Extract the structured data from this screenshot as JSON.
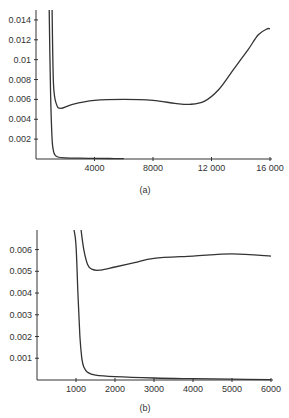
{
  "chart_data": [
    {
      "id": "a",
      "type": "line",
      "caption": "(a)",
      "title": "",
      "xlabel": "",
      "ylabel": "",
      "xlim": [
        0,
        16000
      ],
      "ylim": [
        0,
        0.015
      ],
      "x_ticks": [
        "4000",
        "8000",
        "12 000",
        "16 000"
      ],
      "x_tick_values": [
        4000,
        8000,
        12000,
        16000
      ],
      "y_ticks": [
        "0.002",
        "0.004",
        "0.006",
        "0.008",
        "0.01",
        "0.012",
        "0.014"
      ],
      "y_tick_values": [
        0.002,
        0.004,
        0.006,
        0.008,
        0.01,
        0.012,
        0.014
      ],
      "grid": false,
      "legend": null,
      "series": [
        {
          "name": "curve-upper",
          "x": [
            1100,
            1200,
            1400,
            1700,
            2500,
            4000,
            6000,
            8000,
            9500,
            10500,
            11500,
            12500,
            13500,
            14500,
            15200,
            15800,
            16000
          ],
          "y": [
            0.015,
            0.0075,
            0.0055,
            0.0051,
            0.0055,
            0.0059,
            0.006,
            0.0059,
            0.0056,
            0.0055,
            0.0058,
            0.007,
            0.009,
            0.011,
            0.0125,
            0.0131,
            0.0131
          ]
        },
        {
          "name": "curve-lower",
          "x": [
            900,
            1000,
            1100,
            1200,
            1300,
            1500,
            2000,
            3000,
            4000,
            5000,
            6000
          ],
          "y": [
            0.015,
            0.0065,
            0.002,
            0.0008,
            0.0004,
            0.0002,
            0.00012,
            8e-05,
            6e-05,
            5e-05,
            4e-05
          ]
        }
      ]
    },
    {
      "id": "b",
      "type": "line",
      "caption": "(b)",
      "title": "",
      "xlabel": "",
      "ylabel": "",
      "xlim": [
        0,
        6000
      ],
      "ylim": [
        0,
        0.0069
      ],
      "x_ticks": [
        "1000",
        "2000",
        "3000",
        "4000",
        "5000",
        "6000"
      ],
      "x_tick_values": [
        1000,
        2000,
        3000,
        4000,
        5000,
        6000
      ],
      "y_ticks": [
        "0.001",
        "0.002",
        "0.003",
        "0.004",
        "0.005",
        "0.006"
      ],
      "y_tick_values": [
        0.001,
        0.002,
        0.003,
        0.004,
        0.005,
        0.006
      ],
      "grid": false,
      "legend": null,
      "series": [
        {
          "name": "curve-upper",
          "x": [
            1130,
            1200,
            1300,
            1400,
            1600,
            2000,
            2500,
            3000,
            4000,
            5000,
            6000
          ],
          "y": [
            0.0069,
            0.006,
            0.0053,
            0.0051,
            0.00505,
            0.0052,
            0.0054,
            0.0056,
            0.0057,
            0.0058,
            0.0057
          ],
          "x_label_note": ""
        },
        {
          "name": "curve-lower",
          "x": [
            950,
            1000,
            1050,
            1100,
            1150,
            1200,
            1300,
            1500,
            2000,
            3000,
            4000,
            5000,
            6000
          ],
          "y": [
            0.0069,
            0.0062,
            0.004,
            0.002,
            0.001,
            0.0006,
            0.00035,
            0.00022,
            0.00015,
            9e-05,
            6e-05,
            4e-05,
            2e-05
          ]
        }
      ]
    }
  ]
}
